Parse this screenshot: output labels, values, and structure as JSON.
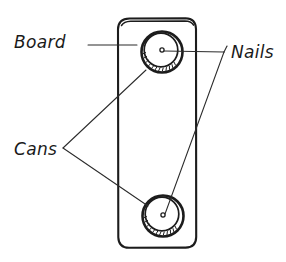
{
  "diagram": {
    "style": "hand-drawn line sketch",
    "background_color": "#ffffff",
    "ink_color": "#1c1c1c",
    "labels": [
      {
        "id": "board",
        "text": "Board",
        "x": 14,
        "y": 48,
        "leader": "horizontal line from label to board left face"
      },
      {
        "id": "nails",
        "text": "Nails",
        "x": 229,
        "y": 58,
        "leader": "branching leader to both nail heads"
      },
      {
        "id": "cans",
        "text": "Cans",
        "x": 14,
        "y": 155,
        "leader": "branching leader to both can rims"
      }
    ],
    "board": {
      "name": "board",
      "left": 118,
      "right": 196,
      "top": 17,
      "bottom": 248,
      "corner_radius": 11,
      "face_color": "#ffffff"
    },
    "cans": [
      {
        "name": "can-top",
        "cx": 162,
        "cy": 52,
        "outer_radius": 21,
        "inner_radius": 17,
        "inner_offset_x": -1,
        "inner_offset_y": -2
      },
      {
        "name": "can-bottom",
        "cx": 163,
        "cy": 216,
        "outer_radius": 21,
        "inner_radius": 17,
        "inner_offset_x": -1,
        "inner_offset_y": -2
      }
    ],
    "nails": [
      {
        "name": "nail-top",
        "cx": 162,
        "cy": 50,
        "radius": 2.1
      },
      {
        "name": "nail-bottom",
        "cx": 163,
        "cy": 215,
        "radius": 2.1
      }
    ],
    "leaders": {
      "board": {
        "x1": 88,
        "y1": 45,
        "x2": 136,
        "y2": 45
      },
      "nails_junction": {
        "x": 223,
        "y": 52
      },
      "nails_to_top": {
        "x1": 165,
        "y1": 51,
        "x2": 223,
        "y2": 52
      },
      "nails_to_bottom": {
        "x1": 223,
        "y1": 52,
        "x2": 165,
        "y2": 214
      },
      "cans_apex": {
        "x": 63,
        "y": 148
      },
      "cans_to_top": {
        "x1": 63,
        "y1": 148,
        "x2": 146,
        "y2": 70
      },
      "cans_to_bottom": {
        "x1": 63,
        "y1": 148,
        "x2": 147,
        "y2": 206
      }
    }
  }
}
